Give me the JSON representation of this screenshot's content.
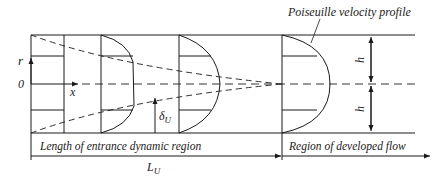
{
  "diagram": {
    "labels": {
      "poiseuille": "Poiseuille velocity profile",
      "r_axis": "r",
      "origin": "0",
      "x_axis": "x",
      "delta": "δ",
      "delta_sub": "U",
      "h_top": "h",
      "h_bottom": "h",
      "entrance_region": "Length of entrance dynamic region",
      "developed_region": "Region of developed flow",
      "length": "L",
      "length_sub": "U"
    },
    "colors": {
      "line": "#1a1a1a",
      "dashed": "#333333",
      "background": "#ffffff"
    }
  }
}
